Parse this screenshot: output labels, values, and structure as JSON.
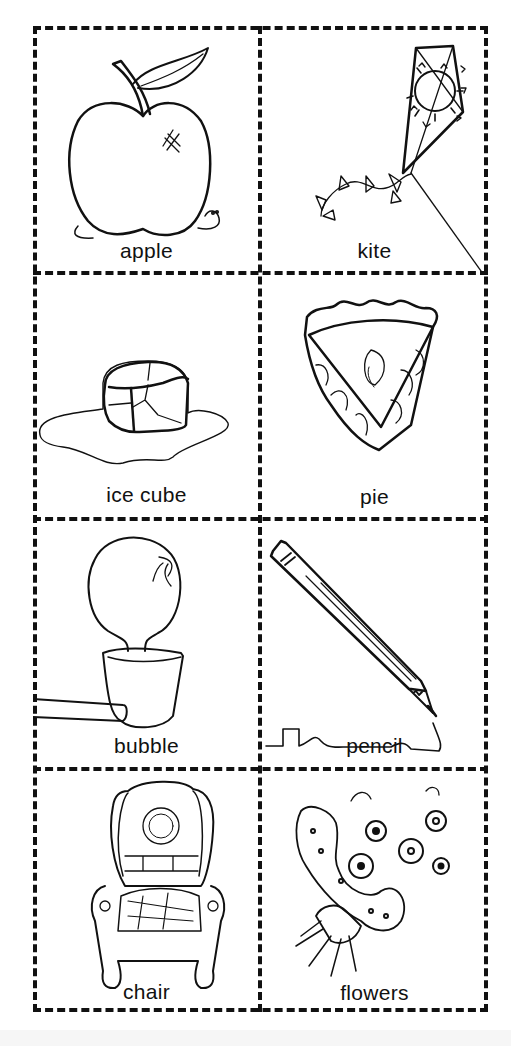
{
  "worksheet": {
    "layout": {
      "columns": 2,
      "rows": 4
    },
    "cards": [
      {
        "word": "apple",
        "picture": "apple-with-worm"
      },
      {
        "word": "kite",
        "picture": "kite-with-sun-and-stars"
      },
      {
        "word": "ice cube",
        "picture": "melting-ice-cube"
      },
      {
        "word": "pie",
        "picture": "slice-of-pie"
      },
      {
        "word": "bubble",
        "picture": "bubble-pipe"
      },
      {
        "word": "pencil",
        "picture": "pencil-writing"
      },
      {
        "word": "chair",
        "picture": "wingback-chair"
      },
      {
        "word": "flowers",
        "picture": "flower-bouquet"
      }
    ]
  }
}
